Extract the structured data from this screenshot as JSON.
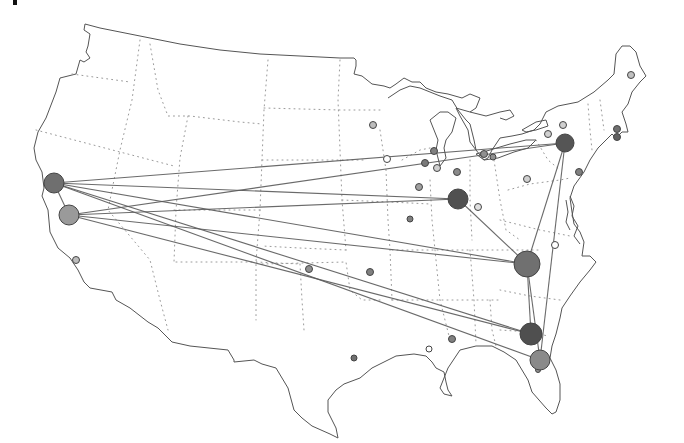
{
  "map": {
    "type": "flight-route network over US state outline map",
    "colors": {
      "background": "#ffffff",
      "coastline": "#555555",
      "state_borders": "#9a9a9a",
      "routes": "#5a5a5a",
      "hub_dark": "#555555",
      "hub_mid": "#7a7a7a",
      "hub_light": "#9a9a9a",
      "minor_node": "#8a8a8a",
      "open_node": "#ffffff"
    },
    "hubs": [
      {
        "id": "sf-bay",
        "x": 54,
        "y": 183,
        "r": 10,
        "fill": "#6f6f6f"
      },
      {
        "id": "central-california",
        "x": 69,
        "y": 215,
        "r": 10,
        "fill": "#9a9a9a"
      },
      {
        "id": "ohio-valley",
        "x": 458,
        "y": 199,
        "r": 10,
        "fill": "#505050"
      },
      {
        "id": "upstate-new-york",
        "x": 565,
        "y": 143,
        "r": 9,
        "fill": "#555555"
      },
      {
        "id": "carolinas",
        "x": 527,
        "y": 264,
        "r": 13,
        "fill": "#707070"
      },
      {
        "id": "north-florida",
        "x": 531,
        "y": 334,
        "r": 11,
        "fill": "#4f4f4f"
      },
      {
        "id": "central-florida",
        "x": 540,
        "y": 360,
        "r": 10,
        "fill": "#8a8a8a"
      }
    ],
    "minor_nodes": [
      {
        "x": 76,
        "y": 260,
        "r": 3.5,
        "fill": "#bdbdbd"
      },
      {
        "x": 309,
        "y": 269,
        "r": 3.5,
        "fill": "#909090"
      },
      {
        "x": 370,
        "y": 272,
        "r": 3.5,
        "fill": "#808080"
      },
      {
        "x": 373,
        "y": 125,
        "r": 3.5,
        "fill": "#bdbdbd"
      },
      {
        "x": 387,
        "y": 159,
        "r": 3.5,
        "fill": "#ffffff"
      },
      {
        "x": 434,
        "y": 151,
        "r": 3.5,
        "fill": "#808080"
      },
      {
        "x": 425,
        "y": 163,
        "r": 3.5,
        "fill": "#7a7a7a"
      },
      {
        "x": 437,
        "y": 168,
        "r": 3.5,
        "fill": "#cfcfcf"
      },
      {
        "x": 457,
        "y": 172,
        "r": 3.5,
        "fill": "#8a8a8a"
      },
      {
        "x": 419,
        "y": 187,
        "r": 3.5,
        "fill": "#a0a0a0"
      },
      {
        "x": 478,
        "y": 207,
        "r": 3.5,
        "fill": "#e0e0e0"
      },
      {
        "x": 410,
        "y": 219,
        "r": 3,
        "fill": "#808080"
      },
      {
        "x": 484,
        "y": 154,
        "r": 3.5,
        "fill": "#909090"
      },
      {
        "x": 493,
        "y": 157,
        "r": 3,
        "fill": "#909090"
      },
      {
        "x": 548,
        "y": 134,
        "r": 3.5,
        "fill": "#d0d0d0"
      },
      {
        "x": 563,
        "y": 125,
        "r": 3.5,
        "fill": "#d0d0d0"
      },
      {
        "x": 527,
        "y": 179,
        "r": 3.5,
        "fill": "#d0d0d0"
      },
      {
        "x": 579,
        "y": 172,
        "r": 3.5,
        "fill": "#808080"
      },
      {
        "x": 617,
        "y": 129,
        "r": 3.5,
        "fill": "#707070"
      },
      {
        "x": 617,
        "y": 137,
        "r": 3.5,
        "fill": "#606060"
      },
      {
        "x": 631,
        "y": 75,
        "r": 3.5,
        "fill": "#c0c0c0"
      },
      {
        "x": 555,
        "y": 245,
        "r": 3.5,
        "fill": "#ffffff"
      },
      {
        "x": 452,
        "y": 339,
        "r": 3.5,
        "fill": "#808080"
      },
      {
        "x": 429,
        "y": 349,
        "r": 3,
        "fill": "#ffffff"
      },
      {
        "x": 354,
        "y": 358,
        "r": 3,
        "fill": "#707070"
      },
      {
        "x": 538,
        "y": 370,
        "r": 2.5,
        "fill": "#909090"
      }
    ],
    "routes": [
      {
        "from": "sf-bay",
        "to": "upstate-new-york"
      },
      {
        "from": "sf-bay",
        "to": "ohio-valley"
      },
      {
        "from": "sf-bay",
        "to": "carolinas"
      },
      {
        "from": "sf-bay",
        "to": "north-florida"
      },
      {
        "from": "sf-bay",
        "to": "central-florida"
      },
      {
        "from": "central-california",
        "to": "upstate-new-york"
      },
      {
        "from": "central-california",
        "to": "ohio-valley"
      },
      {
        "from": "central-california",
        "to": "carolinas"
      },
      {
        "from": "central-california",
        "to": "north-florida"
      },
      {
        "from": "upstate-new-york",
        "to": "carolinas"
      },
      {
        "from": "upstate-new-york",
        "to": "central-florida"
      },
      {
        "from": "carolinas",
        "to": "north-florida"
      },
      {
        "from": "carolinas",
        "to": "central-florida"
      },
      {
        "from": "ohio-valley",
        "to": "carolinas"
      },
      {
        "from": "sf-bay",
        "to": "central-california"
      }
    ]
  }
}
